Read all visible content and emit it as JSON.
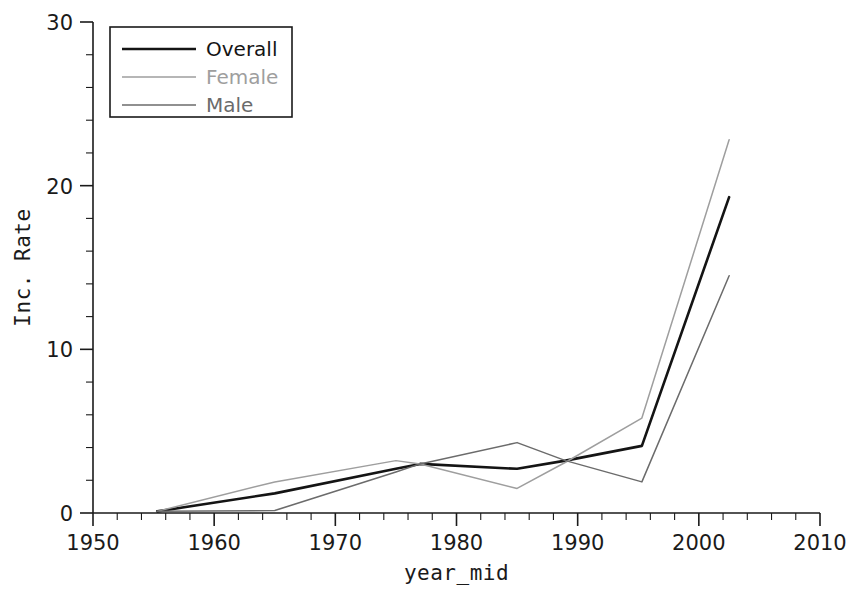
{
  "chart_data": {
    "type": "line",
    "title": "",
    "xlabel": "year_mid",
    "ylabel": "Inc. Rate",
    "xlim": [
      1950,
      2010
    ],
    "ylim": [
      0,
      30
    ],
    "x_ticks": [
      1950,
      1960,
      1970,
      1980,
      1990,
      2000,
      2010
    ],
    "y_ticks": [
      0,
      10,
      20,
      30
    ],
    "x_minor_step": 2,
    "y_minor_step": 2,
    "grid": false,
    "legend_position": "top-left",
    "x": [
      1955.3,
      1965,
      1975,
      1977,
      1985,
      1989,
      1995.3,
      2002.5
    ],
    "series": [
      {
        "name": "Overall",
        "color": "#141414",
        "width": 2.6,
        "values": [
          0.1,
          1.2,
          2.7,
          3.0,
          2.7,
          3.2,
          4.1,
          19.3
        ]
      },
      {
        "name": "Female",
        "color": "#9e9e9e",
        "width": 1.5,
        "values": [
          0.1,
          1.9,
          3.2,
          3.0,
          1.5,
          3.1,
          5.8,
          22.8
        ]
      },
      {
        "name": "Male",
        "color": "#6b6b6b",
        "width": 1.5,
        "values": [
          0.1,
          0.15,
          2.5,
          3.0,
          4.3,
          3.2,
          1.9,
          14.5
        ]
      }
    ]
  },
  "legend": {
    "entries": [
      {
        "label": "Overall"
      },
      {
        "label": "Female"
      },
      {
        "label": "Male"
      }
    ]
  },
  "axis": {
    "x_labels": [
      "1950",
      "1960",
      "1970",
      "1980",
      "1990",
      "2000",
      "2010"
    ],
    "y_labels": [
      "0",
      "10",
      "20",
      "30"
    ],
    "x_title": "year_mid",
    "y_title": "Inc. Rate"
  }
}
